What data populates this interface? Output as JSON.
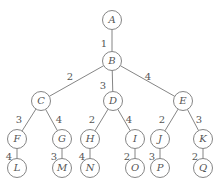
{
  "diagram": {
    "type": "weighted-tree",
    "node_radius": 9.5,
    "nodes": [
      {
        "id": "A",
        "label": "A",
        "x": 112,
        "y": 20
      },
      {
        "id": "B",
        "label": "B",
        "x": 112,
        "y": 61
      },
      {
        "id": "C",
        "label": "C",
        "x": 41,
        "y": 101
      },
      {
        "id": "D",
        "label": "D",
        "x": 113,
        "y": 101
      },
      {
        "id": "E",
        "label": "E",
        "x": 183,
        "y": 101
      },
      {
        "id": "F",
        "label": "F",
        "x": 17,
        "y": 139
      },
      {
        "id": "G",
        "label": "G",
        "x": 62,
        "y": 139
      },
      {
        "id": "H",
        "label": "H",
        "x": 90,
        "y": 139
      },
      {
        "id": "I",
        "label": "I",
        "x": 135,
        "y": 139
      },
      {
        "id": "J",
        "label": "J",
        "x": 160,
        "y": 139
      },
      {
        "id": "K",
        "label": "K",
        "x": 203,
        "y": 139
      },
      {
        "id": "L",
        "label": "L",
        "x": 17,
        "y": 168
      },
      {
        "id": "M",
        "label": "M",
        "x": 62,
        "y": 168
      },
      {
        "id": "N",
        "label": "N",
        "x": 90,
        "y": 168
      },
      {
        "id": "O",
        "label": "O",
        "x": 135,
        "y": 168
      },
      {
        "id": "P",
        "label": "P",
        "x": 160,
        "y": 168
      },
      {
        "id": "Q",
        "label": "Q",
        "x": 203,
        "y": 168
      }
    ],
    "edges": [
      {
        "from": "A",
        "to": "B",
        "weight": "1",
        "lx": 104,
        "ly": 44
      },
      {
        "from": "B",
        "to": "C",
        "weight": "2",
        "lx": 70,
        "ly": 77
      },
      {
        "from": "B",
        "to": "D",
        "weight": "3",
        "lx": 103,
        "ly": 86
      },
      {
        "from": "B",
        "to": "E",
        "weight": "4",
        "lx": 148,
        "ly": 77
      },
      {
        "from": "C",
        "to": "F",
        "weight": "3",
        "lx": 19,
        "ly": 120
      },
      {
        "from": "C",
        "to": "G",
        "weight": "4",
        "lx": 59,
        "ly": 120
      },
      {
        "from": "D",
        "to": "H",
        "weight": "2",
        "lx": 92,
        "ly": 120
      },
      {
        "from": "D",
        "to": "I",
        "weight": "4",
        "lx": 129,
        "ly": 120
      },
      {
        "from": "E",
        "to": "J",
        "weight": "2",
        "lx": 162,
        "ly": 120
      },
      {
        "from": "E",
        "to": "K",
        "weight": "3",
        "lx": 199,
        "ly": 120
      },
      {
        "from": "F",
        "to": "L",
        "weight": "4",
        "lx": 9,
        "ly": 157
      },
      {
        "from": "G",
        "to": "M",
        "weight": "3",
        "lx": 54,
        "ly": 157
      },
      {
        "from": "H",
        "to": "N",
        "weight": "4",
        "lx": 82,
        "ly": 157
      },
      {
        "from": "I",
        "to": "O",
        "weight": "2",
        "lx": 127,
        "ly": 157
      },
      {
        "from": "J",
        "to": "P",
        "weight": "3",
        "lx": 152,
        "ly": 157
      },
      {
        "from": "K",
        "to": "Q",
        "weight": "2",
        "lx": 195,
        "ly": 157
      }
    ]
  }
}
